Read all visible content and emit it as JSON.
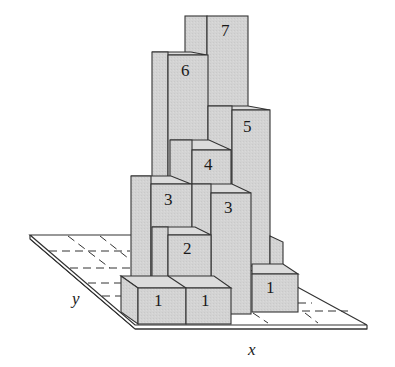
{
  "figure": {
    "type": "3d-bar-diagram",
    "colors": {
      "face": "#d4d4d4",
      "side": "#c6c6c6",
      "top": "#dcdcdc",
      "edge": "#3a3a3a",
      "plane": "#ffffff"
    },
    "axes": {
      "x_label": "x",
      "y_label": "y"
    },
    "columns": [
      {
        "id": "col-7",
        "label": "7",
        "height": 7
      },
      {
        "id": "col-6",
        "label": "6",
        "height": 6
      },
      {
        "id": "col-5",
        "label": "5",
        "height": 5
      },
      {
        "id": "col-4",
        "label": "4",
        "height": 4
      },
      {
        "id": "col-3a",
        "label": "3",
        "height": 3
      },
      {
        "id": "col-3b",
        "label": "3",
        "height": 3
      },
      {
        "id": "col-2",
        "label": "2",
        "height": 2
      },
      {
        "id": "col-1a",
        "label": "1",
        "height": 1
      },
      {
        "id": "col-1b",
        "label": "1",
        "height": 1
      },
      {
        "id": "col-1c",
        "label": "1",
        "height": 1
      }
    ]
  }
}
